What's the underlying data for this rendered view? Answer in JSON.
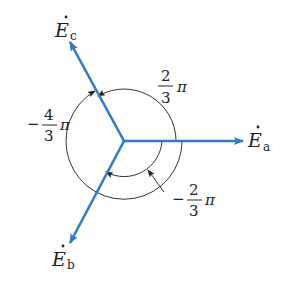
{
  "diagram": {
    "colors": {
      "phasor": "#2f7bc4",
      "arc": "#333333",
      "text": "#222222"
    },
    "phasors": [
      {
        "id": "a",
        "label": "E",
        "sub": "a",
        "angle": "0"
      },
      {
        "id": "b",
        "label": "E",
        "sub": "b",
        "angle": "-2π/3"
      },
      {
        "id": "c",
        "label": "E",
        "sub": "c",
        "angle": "2π/3"
      }
    ],
    "angles": [
      {
        "sign": "",
        "num": "2",
        "den": "3",
        "pi": "π"
      },
      {
        "sign": "−",
        "num": "4",
        "den": "3",
        "pi": "π"
      },
      {
        "sign": "−",
        "num": "2",
        "den": "3",
        "pi": "π"
      }
    ]
  }
}
